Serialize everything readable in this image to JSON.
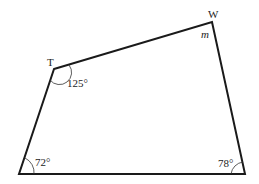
{
  "diagram": {
    "type": "quadrilateral",
    "vertices": {
      "T": {
        "label": "T"
      },
      "W": {
        "label": "W"
      }
    },
    "angles": {
      "T": "125°",
      "W": "m",
      "bottom_left": "72°",
      "bottom_right": "78°"
    },
    "colors": {
      "stroke": "#1a1a1a",
      "background": "#ffffff"
    }
  }
}
